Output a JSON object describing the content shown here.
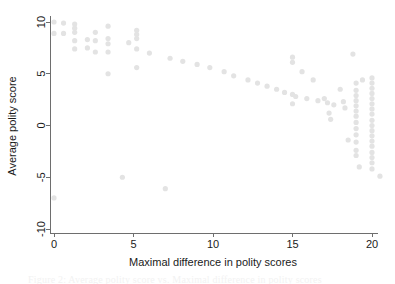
{
  "figure": {
    "background_color": "#ffffff",
    "axis_color": "#6e6e6e",
    "point_color": "#e3e3e3",
    "text_color": "#1a1a1a"
  },
  "caption": {
    "text": "Figure 2: Average polity score vs. Maximal difference in polity scores"
  },
  "chart_data": {
    "type": "scatter",
    "title": "",
    "xlabel": "Maximal difference in polity scores",
    "ylabel": "Average polity score",
    "xlim": [
      -0.85,
      21.0
    ],
    "ylim": [
      -11.0,
      10.8
    ],
    "xticks": [
      0,
      5,
      10,
      15,
      20
    ],
    "xticklabels": [
      "0",
      "5",
      "10",
      "15",
      "20"
    ],
    "yticks": [
      -10,
      -5,
      0,
      5,
      10
    ],
    "yticklabels": [
      "-10",
      "-5",
      "0",
      "5",
      "10"
    ],
    "grid": false,
    "legend": null,
    "marker": {
      "shape": "circle",
      "color": "#e3e3e3",
      "radius_px": 2.6,
      "opacity": 1
    },
    "points": [
      {
        "x": 0.0,
        "y": 10.0
      },
      {
        "x": 0.0,
        "y": 8.9
      },
      {
        "x": 0.0,
        "y": -7.0
      },
      {
        "x": 0.6,
        "y": 9.9
      },
      {
        "x": 0.6,
        "y": 8.9
      },
      {
        "x": 1.3,
        "y": 9.8
      },
      {
        "x": 1.3,
        "y": 9.4
      },
      {
        "x": 1.3,
        "y": 9.0
      },
      {
        "x": 1.3,
        "y": 8.2
      },
      {
        "x": 1.3,
        "y": 7.4
      },
      {
        "x": 2.1,
        "y": 8.3
      },
      {
        "x": 2.1,
        "y": 7.5
      },
      {
        "x": 2.6,
        "y": 9.0
      },
      {
        "x": 2.6,
        "y": 8.2
      },
      {
        "x": 2.6,
        "y": 7.1
      },
      {
        "x": 3.4,
        "y": 9.6
      },
      {
        "x": 3.4,
        "y": 8.4
      },
      {
        "x": 3.4,
        "y": 7.9
      },
      {
        "x": 3.4,
        "y": 7.1
      },
      {
        "x": 3.4,
        "y": 5.0
      },
      {
        "x": 4.3,
        "y": -5.0
      },
      {
        "x": 4.7,
        "y": 8.0
      },
      {
        "x": 5.2,
        "y": 9.2
      },
      {
        "x": 5.2,
        "y": 8.8
      },
      {
        "x": 5.2,
        "y": 8.4
      },
      {
        "x": 5.2,
        "y": 7.4
      },
      {
        "x": 5.2,
        "y": 5.6
      },
      {
        "x": 6.0,
        "y": 7.0
      },
      {
        "x": 7.0,
        "y": -6.1
      },
      {
        "x": 7.3,
        "y": 6.5
      },
      {
        "x": 8.1,
        "y": 6.2
      },
      {
        "x": 9.0,
        "y": 5.9
      },
      {
        "x": 9.8,
        "y": 5.6
      },
      {
        "x": 10.7,
        "y": 5.2
      },
      {
        "x": 11.3,
        "y": 4.8
      },
      {
        "x": 12.2,
        "y": 4.4
      },
      {
        "x": 12.8,
        "y": 4.1
      },
      {
        "x": 13.4,
        "y": 3.8
      },
      {
        "x": 14.0,
        "y": 3.5
      },
      {
        "x": 14.5,
        "y": 3.2
      },
      {
        "x": 15.0,
        "y": 6.6
      },
      {
        "x": 15.0,
        "y": 6.1
      },
      {
        "x": 15.0,
        "y": 3.0
      },
      {
        "x": 15.0,
        "y": 2.1
      },
      {
        "x": 15.2,
        "y": 2.8
      },
      {
        "x": 15.6,
        "y": 5.2
      },
      {
        "x": 15.9,
        "y": 2.6
      },
      {
        "x": 16.3,
        "y": 4.4
      },
      {
        "x": 16.6,
        "y": 2.4
      },
      {
        "x": 17.0,
        "y": 2.6
      },
      {
        "x": 17.2,
        "y": 2.2
      },
      {
        "x": 17.3,
        "y": 1.2
      },
      {
        "x": 17.4,
        "y": 0.6
      },
      {
        "x": 17.6,
        "y": 2.0
      },
      {
        "x": 18.0,
        "y": 3.5
      },
      {
        "x": 18.2,
        "y": 2.3
      },
      {
        "x": 18.3,
        "y": 1.7
      },
      {
        "x": 18.5,
        "y": -1.4
      },
      {
        "x": 18.8,
        "y": 6.9
      },
      {
        "x": 19.0,
        "y": 4.1
      },
      {
        "x": 19.0,
        "y": 3.4
      },
      {
        "x": 19.0,
        "y": 2.9
      },
      {
        "x": 19.0,
        "y": 2.4
      },
      {
        "x": 19.0,
        "y": 1.9
      },
      {
        "x": 19.0,
        "y": 1.4
      },
      {
        "x": 19.0,
        "y": 0.9
      },
      {
        "x": 19.0,
        "y": 0.3
      },
      {
        "x": 19.0,
        "y": -0.3
      },
      {
        "x": 19.0,
        "y": -0.9
      },
      {
        "x": 19.0,
        "y": -1.6
      },
      {
        "x": 19.0,
        "y": -2.4
      },
      {
        "x": 19.0,
        "y": -2.9
      },
      {
        "x": 19.2,
        "y": -4.0
      },
      {
        "x": 19.4,
        "y": 4.4
      },
      {
        "x": 20.0,
        "y": 4.6
      },
      {
        "x": 20.0,
        "y": 4.1
      },
      {
        "x": 20.0,
        "y": 3.6
      },
      {
        "x": 20.0,
        "y": 3.1
      },
      {
        "x": 20.0,
        "y": 2.6
      },
      {
        "x": 20.0,
        "y": 2.1
      },
      {
        "x": 20.0,
        "y": 1.6
      },
      {
        "x": 20.0,
        "y": 1.1
      },
      {
        "x": 20.0,
        "y": 0.5
      },
      {
        "x": 20.0,
        "y": 0.0
      },
      {
        "x": 20.0,
        "y": -0.5
      },
      {
        "x": 20.0,
        "y": -1.0
      },
      {
        "x": 20.0,
        "y": -1.5
      },
      {
        "x": 20.0,
        "y": -2.0
      },
      {
        "x": 20.0,
        "y": -2.6
      },
      {
        "x": 20.0,
        "y": -3.1
      },
      {
        "x": 20.0,
        "y": -3.6
      },
      {
        "x": 20.0,
        "y": -4.2
      },
      {
        "x": 20.5,
        "y": -4.9
      }
    ]
  }
}
